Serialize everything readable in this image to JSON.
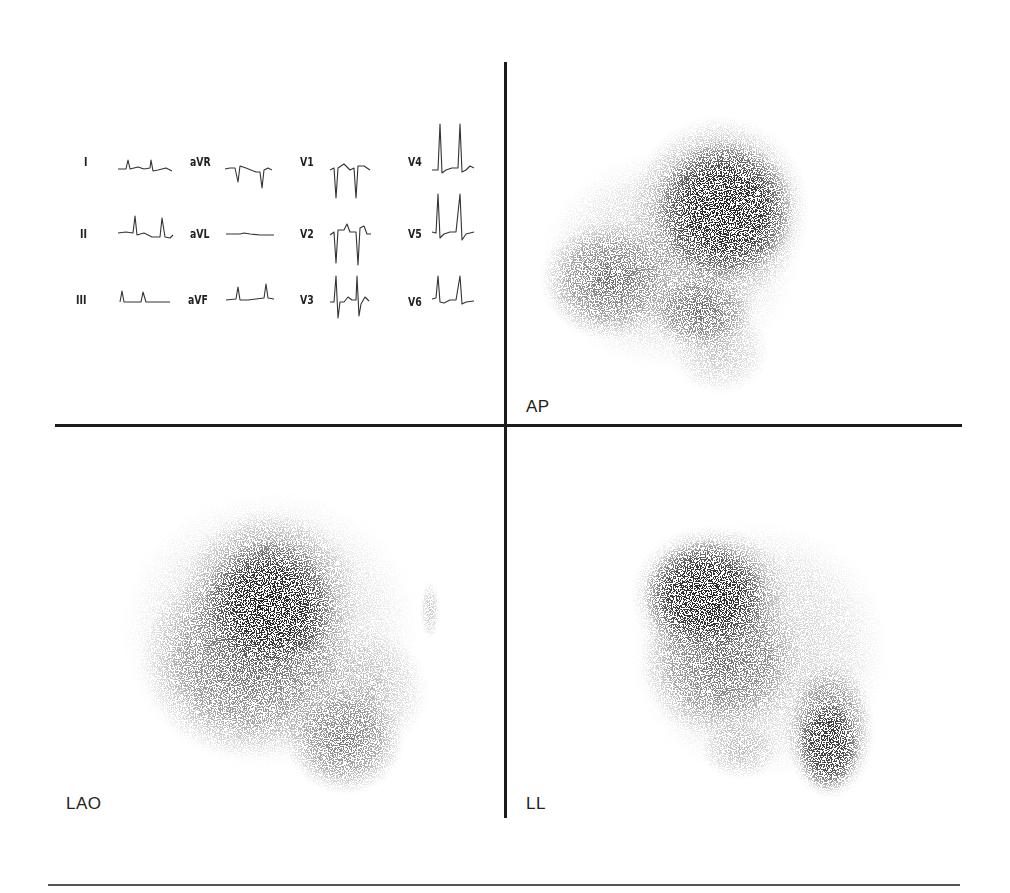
{
  "figure": {
    "type": "ECG with cardiac blood-pool scintigrams",
    "views": [
      {
        "id": "ap",
        "label": "AP"
      },
      {
        "id": "lao",
        "label": "LAO"
      },
      {
        "id": "ll",
        "label": "LL"
      }
    ],
    "ecg": {
      "leads": [
        {
          "name": "I"
        },
        {
          "name": "II"
        },
        {
          "name": "III"
        },
        {
          "name": "aVR"
        },
        {
          "name": "aVL"
        },
        {
          "name": "aVF"
        },
        {
          "name": "V1"
        },
        {
          "name": "V2"
        },
        {
          "name": "V3"
        },
        {
          "name": "V4"
        },
        {
          "name": "V5"
        },
        {
          "name": "V6"
        }
      ]
    },
    "colors": {
      "ink": "#1c1c1c",
      "background": "#ffffff",
      "scan_dark": "#2a2a2a"
    }
  }
}
